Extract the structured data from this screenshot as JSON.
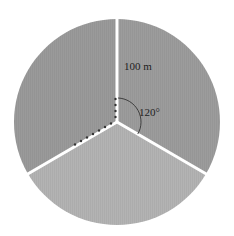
{
  "diagram": {
    "type": "circle divided into three equal sectors",
    "sectors": [
      {
        "name": "top-right",
        "fill": "#9c9c9c"
      },
      {
        "name": "top-left",
        "fill": "#9a9a9a"
      },
      {
        "name": "bottom",
        "fill": "#b3b3b3"
      }
    ],
    "radius_label": "100 m",
    "angle_label": "120°",
    "divider_color": "#ffffff",
    "dotted_marker_color": "#333333"
  }
}
